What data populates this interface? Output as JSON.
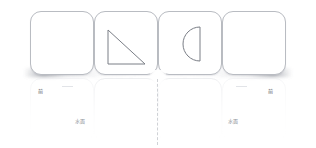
{
  "scene": {
    "background_color": "#ffffff",
    "card_border_color": "#b9bcc2",
    "shape_stroke_color": "#7a7e86",
    "reflection_border_color": "#d9dbe0",
    "axis_color": "#c8cbd0"
  },
  "cards": [
    {
      "id": "card-1",
      "shape": "none",
      "shape_label": ""
    },
    {
      "id": "card-2",
      "shape": "right-triangle",
      "shape_label": ""
    },
    {
      "id": "card-3",
      "shape": "semicircle",
      "shape_label": ""
    },
    {
      "id": "card-4",
      "shape": "none",
      "shape_label": ""
    }
  ],
  "labels": {
    "top_left": "前",
    "top_right": "前",
    "bottom_left": "水面",
    "bottom_right": "水面"
  }
}
